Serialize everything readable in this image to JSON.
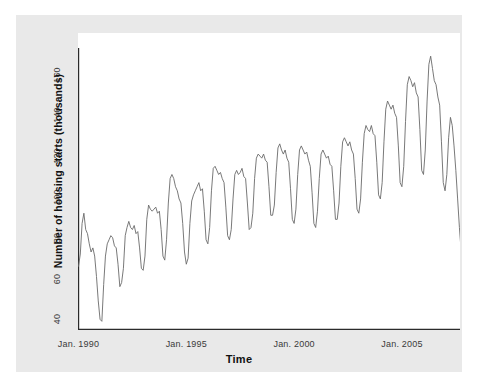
{
  "chart_data": {
    "type": "line",
    "title": "",
    "xlabel": "Time",
    "ylabel": "Number of housing starts (thousands)",
    "grid": false,
    "legend": null,
    "xlim": [
      1990.0,
      2007.6
    ],
    "ylim": [
      36,
      174
    ],
    "yticks": [
      40,
      60,
      80,
      100,
      120,
      140,
      160
    ],
    "ytick_labels": [
      "40",
      "60",
      "80",
      "100",
      "120",
      "140",
      "160"
    ],
    "xticks": [
      1990.0,
      1995.0,
      2000.0,
      2005.0
    ],
    "xtick_labels": [
      "Jan. 1990",
      "Jan. 1995",
      "Jan. 2000",
      "Jan. 2005"
    ],
    "series": [
      {
        "name": "Housing starts",
        "color": "#6a6a6a",
        "x_start": 1990.0,
        "x_step": 0.08333,
        "values": [
          67,
          73,
          88,
          93,
          85,
          83,
          78,
          74,
          76,
          72,
          62,
          50,
          41,
          40,
          58,
          72,
          78,
          80,
          82,
          81,
          77,
          76,
          68,
          57,
          59,
          66,
          82,
          86,
          89,
          86,
          85,
          87,
          83,
          84,
          76,
          66,
          65,
          72,
          90,
          97,
          95,
          94,
          95,
          96,
          93,
          94,
          85,
          72,
          70,
          80,
          98,
          110,
          112,
          110,
          106,
          104,
          100,
          98,
          88,
          74,
          68,
          71,
          88,
          99,
          102,
          104,
          106,
          108,
          104,
          105,
          94,
          80,
          78,
          86,
          104,
          115,
          116,
          114,
          112,
          113,
          110,
          108,
          96,
          82,
          80,
          85,
          100,
          112,
          114,
          112,
          113,
          115,
          111,
          110,
          98,
          85,
          86,
          93,
          110,
          120,
          122,
          121,
          120,
          122,
          119,
          118,
          106,
          92,
          92,
          97,
          113,
          125,
          127,
          124,
          122,
          124,
          120,
          118,
          105,
          90,
          88,
          95,
          112,
          124,
          126,
          124,
          122,
          123,
          119,
          116,
          103,
          88,
          86,
          94,
          110,
          122,
          124,
          122,
          120,
          121,
          117,
          116,
          104,
          90,
          90,
          98,
          116,
          128,
          130,
          128,
          126,
          128,
          124,
          122,
          110,
          95,
          93,
          100,
          118,
          132,
          136,
          134,
          133,
          136,
          132,
          131,
          118,
          102,
          100,
          108,
          128,
          144,
          148,
          146,
          144,
          146,
          142,
          140,
          126,
          108,
          106,
          116,
          138,
          156,
          160,
          158,
          155,
          157,
          152,
          150,
          134,
          114,
          112,
          124,
          148,
          166,
          170,
          164,
          158,
          156,
          150,
          146,
          128,
          108,
          104,
          112,
          130,
          140,
          136,
          126,
          114,
          100,
          86,
          74,
          60,
          52
        ]
      }
    ]
  },
  "figure": {
    "background_color": "#e9e9e9",
    "panel_color": "#ffffff",
    "axis_color": "#2b2b2b"
  }
}
